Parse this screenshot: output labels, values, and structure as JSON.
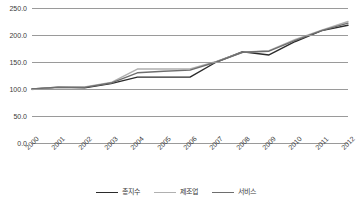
{
  "chart_data": {
    "type": "line",
    "title": "",
    "xlabel": "",
    "ylabel": "",
    "categories": [
      "2000",
      "2001",
      "2002",
      "2003",
      "2004",
      "2005",
      "2006",
      "2007",
      "2008",
      "2009",
      "2010",
      "2011",
      "2012"
    ],
    "ylim": [
      0,
      250
    ],
    "ytick_labels": [
      "0.0",
      "50.0",
      "100.0",
      "150.0",
      "200.0",
      "250.0"
    ],
    "ytick_values": [
      0,
      50,
      100,
      150,
      200,
      250
    ],
    "grid": true,
    "legend_position": "bottom",
    "series": [
      {
        "name": "총지수",
        "color": "#2b2b2b",
        "values": [
          100.0,
          103.0,
          102.0,
          110.0,
          122.0,
          122.0,
          122.0,
          150.0,
          169.0,
          163.0,
          188.0,
          208.0,
          218.0
        ]
      },
      {
        "name": "제조업",
        "color": "#b0b0b0",
        "values": [
          99.0,
          104.0,
          104.0,
          112.0,
          137.0,
          137.0,
          137.0,
          151.0,
          168.0,
          171.0,
          192.0,
          209.0,
          225.0
        ]
      },
      {
        "name": "서비스",
        "color": "#6e6e6e",
        "values": [
          100.0,
          103.5,
          103.0,
          111.0,
          130.0,
          133.0,
          135.0,
          150.0,
          168.0,
          170.0,
          190.0,
          208.0,
          222.0
        ]
      }
    ]
  },
  "legend": {
    "items": [
      {
        "label": "총지수"
      },
      {
        "label": "제조업"
      },
      {
        "label": "서비스"
      }
    ]
  }
}
